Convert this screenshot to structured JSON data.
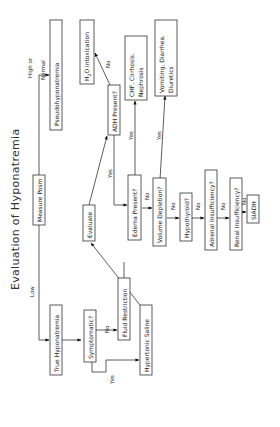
{
  "diagram": {
    "title": "Evaluation of Hyponatremia",
    "orientation": "rotated-90-ccw",
    "nodes": {
      "measure_posm": "Measure Posm",
      "pseudo": "Pseudohyponatremia",
      "true_hypo": "True Hyponatremia",
      "symptomatic": "Symptomatic?",
      "fluid_restriction": "Fluid Restriction",
      "hypertonic_saline": "Hypertonic Saline",
      "evaluate": "Evaluate",
      "adh_present": "ADH Present?",
      "h2o_intox_prefix": "H",
      "h2o_intox_sub": "2",
      "h2o_intox_suffix": "O intoxication",
      "chf_line1": "CHF, Cirrhosis,",
      "chf_line2": "Nephrosis",
      "vomiting_line1": "Vomiting, Diarrhea,",
      "vomiting_line2": "Diuretics",
      "edema_present": "Edema Present?",
      "volume_depletion": "Volume Depletion?",
      "hypothyroid": "Hypothyroid?",
      "adrenal": "Adrenal Insufficiency?",
      "renal": "Renal Insufficiency?",
      "siadh": "SIADH"
    },
    "edge_labels": {
      "high_or": "High or",
      "normal": "Normal",
      "low": "Low",
      "no_fluid": "No",
      "yes_saline": "Yes",
      "yes_adh": "Yes",
      "no_h2o": "No",
      "yes_chf": "Yes",
      "yes_vomit": "Yes",
      "no_volume": "No",
      "no_hypothyroid": "No",
      "no_adrenal": "No",
      "no_renal": "No",
      "no_siadh": "No"
    }
  }
}
